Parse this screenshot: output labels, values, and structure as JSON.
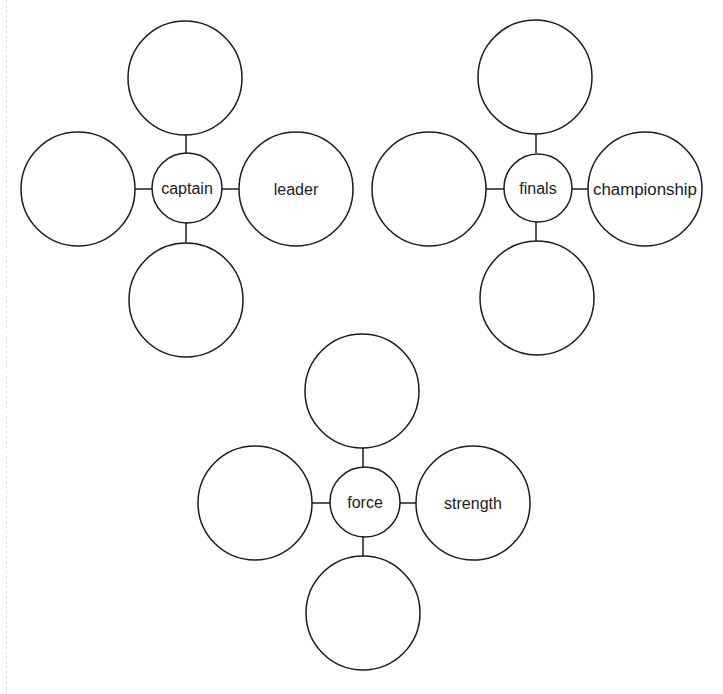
{
  "worksheet": {
    "type": "word-web vocabulary worksheet",
    "colors": {
      "stroke": "#1c1c1c",
      "background": "#ffffff"
    },
    "webs": [
      {
        "center": {
          "label": "captain",
          "cx": 187,
          "cy": 188,
          "r": 35
        },
        "nodes": {
          "top": {
            "label": "",
            "cx": 185,
            "cy": 78,
            "r": 57
          },
          "left": {
            "label": "",
            "cx": 78,
            "cy": 189,
            "r": 57
          },
          "right": {
            "label": "leader",
            "cx": 296,
            "cy": 189,
            "r": 57
          },
          "bottom": {
            "label": "",
            "cx": 186,
            "cy": 300,
            "r": 57
          }
        }
      },
      {
        "center": {
          "label": "finals",
          "cx": 538,
          "cy": 188,
          "r": 34
        },
        "nodes": {
          "top": {
            "label": "",
            "cx": 535,
            "cy": 77,
            "r": 57
          },
          "left": {
            "label": "",
            "cx": 429,
            "cy": 189,
            "r": 57
          },
          "right": {
            "label": "championship",
            "cx": 645,
            "cy": 189,
            "r": 57
          },
          "bottom": {
            "label": "",
            "cx": 537,
            "cy": 298,
            "r": 57
          }
        }
      },
      {
        "center": {
          "label": "force",
          "cx": 365,
          "cy": 502,
          "r": 35
        },
        "nodes": {
          "top": {
            "label": "",
            "cx": 362,
            "cy": 391,
            "r": 57
          },
          "left": {
            "label": "",
            "cx": 255,
            "cy": 503,
            "r": 57
          },
          "right": {
            "label": "strength",
            "cx": 473,
            "cy": 503,
            "r": 57
          },
          "bottom": {
            "label": "",
            "cx": 363,
            "cy": 613,
            "r": 57
          }
        }
      }
    ]
  }
}
